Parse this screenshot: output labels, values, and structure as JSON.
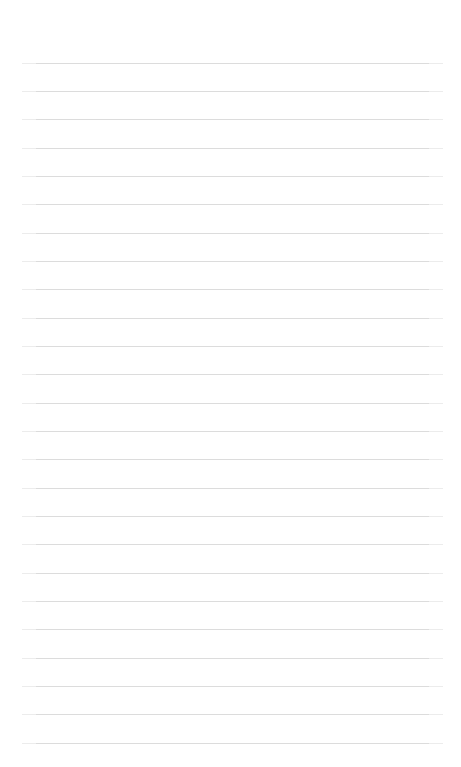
{
  "page": {
    "kind": "ruled-notepaper",
    "width": 461,
    "height": 767,
    "background_color": "#ffffff",
    "written_text": "",
    "title": ""
  },
  "rules": {
    "count": 25,
    "color": "#dcdcdc",
    "thickness_px": 1,
    "left_x": 22,
    "right_x": 443,
    "line_width": 421,
    "first_line_y": 63,
    "spacing_px": 28.3,
    "y_positions": [
      63,
      91,
      119,
      148,
      176,
      204,
      233,
      261,
      289,
      318,
      346,
      374,
      403,
      431,
      459,
      488,
      516,
      544,
      573,
      601,
      629,
      658,
      686,
      714,
      743
    ]
  }
}
